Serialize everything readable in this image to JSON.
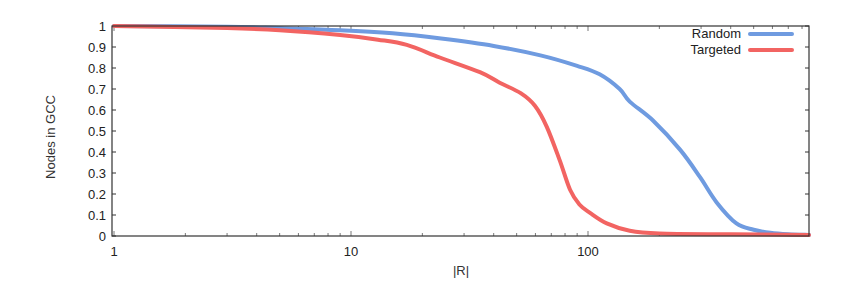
{
  "chart_data": {
    "type": "line",
    "title": "",
    "xlabel": "|R|",
    "ylabel": "Nodes in GCC",
    "xscale": "log",
    "xlim": [
      1,
      860
    ],
    "ylim": [
      0,
      1
    ],
    "grid": false,
    "legend_position": "top-right",
    "x_ticks": [
      {
        "value": 1,
        "label": "1"
      },
      {
        "value": 10,
        "label": "10"
      },
      {
        "value": 100,
        "label": "100"
      }
    ],
    "y_ticks": [
      {
        "value": 0,
        "label": "0"
      },
      {
        "value": 0.1,
        "label": "0.1"
      },
      {
        "value": 0.2,
        "label": "0.2"
      },
      {
        "value": 0.3,
        "label": "0.3"
      },
      {
        "value": 0.4,
        "label": "0.4"
      },
      {
        "value": 0.5,
        "label": "0.5"
      },
      {
        "value": 0.6,
        "label": "0.6"
      },
      {
        "value": 0.7,
        "label": "0.7"
      },
      {
        "value": 0.8,
        "label": "0.8"
      },
      {
        "value": 0.9,
        "label": "0.9"
      },
      {
        "value": 1,
        "label": "1"
      }
    ],
    "series": [
      {
        "name": "Random",
        "color": "#6f9be0",
        "x": [
          1,
          3,
          5,
          9,
          15,
          24,
          40,
          63,
          90,
          112,
          136,
          150,
          188,
          245,
          297,
          349,
          423,
          500,
          588,
          700,
          860
        ],
        "y": [
          1.0,
          0.997,
          0.99,
          0.98,
          0.965,
          0.94,
          0.905,
          0.86,
          0.81,
          0.77,
          0.7,
          0.64,
          0.55,
          0.41,
          0.28,
          0.16,
          0.06,
          0.03,
          0.015,
          0.008,
          0.005
        ]
      },
      {
        "name": "Targeted",
        "color": "#f26462",
        "x": [
          1,
          3,
          5,
          9,
          13,
          17.2,
          23.7,
          35,
          42.4,
          52,
          59.7,
          67,
          76,
          84,
          92,
          102,
          120,
          150,
          200,
          400,
          860
        ],
        "y": [
          1.0,
          0.99,
          0.98,
          0.957,
          0.935,
          0.91,
          0.85,
          0.78,
          0.73,
          0.68,
          0.62,
          0.52,
          0.36,
          0.22,
          0.15,
          0.11,
          0.06,
          0.025,
          0.012,
          0.008,
          0.005
        ]
      }
    ]
  }
}
